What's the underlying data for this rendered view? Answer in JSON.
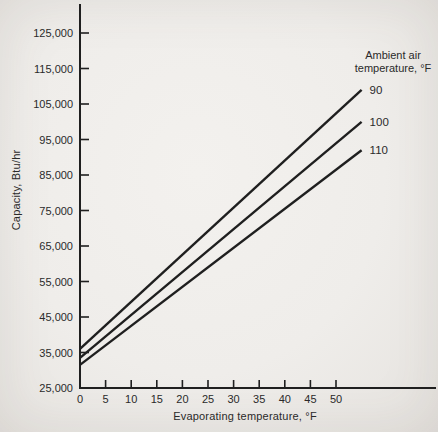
{
  "page": {
    "background_hex": "#efedea",
    "ink_hex": "#1f1f1f",
    "text_hex": "#2a2a2a"
  },
  "chart_data": {
    "type": "line",
    "title": "",
    "xlabel": "Evaporating temperature, °F",
    "ylabel": "Capacity, Btu/hr",
    "xlim": [
      0,
      69.5
    ],
    "ylim": [
      25000,
      133000
    ],
    "x_ticks": [
      0,
      5,
      10,
      15,
      20,
      25,
      30,
      35,
      40,
      45,
      50
    ],
    "y_ticks": [
      25000,
      35000,
      45000,
      55000,
      65000,
      75000,
      85000,
      95000,
      105000,
      115000,
      125000
    ],
    "y_tick_labels": [
      "25,000",
      "35,000",
      "45,000",
      "55,000",
      "65,000",
      "75,000",
      "85,000",
      "95,000",
      "105,000",
      "115,000",
      "125,000"
    ],
    "grid": false,
    "legend_title": [
      "Ambient air",
      "temperature, °F"
    ],
    "legend_position": "top-right",
    "series": [
      {
        "name": "90",
        "x": [
          0,
          55
        ],
        "values": [
          36000,
          109000
        ]
      },
      {
        "name": "100",
        "x": [
          0,
          55
        ],
        "values": [
          33500,
          100000
        ]
      },
      {
        "name": "110",
        "x": [
          0,
          55
        ],
        "values": [
          31500,
          92000
        ]
      }
    ]
  }
}
